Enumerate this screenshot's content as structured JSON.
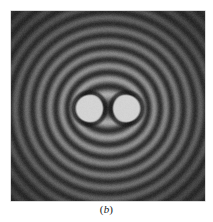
{
  "figure": {
    "caption": "(b)",
    "caption_label": "b",
    "caption_open_paren": "(",
    "caption_close_paren": ")",
    "panel_width": 194,
    "panel_height": 190,
    "panel_left": 11,
    "panel_top": 11
  },
  "colors": {
    "page_background": "#ffffff",
    "panel_background": "#1b1b1b",
    "panel_border": "#b5b5b5",
    "fringe_bright": "#c8c8c8",
    "fringe_dark": "#242424",
    "aperture_fill": "#e2e2e2",
    "caption_text": "#1c1c1c"
  },
  "chart_data": {
    "type": "heatmap",
    "title": "",
    "subtitle": "",
    "xlabel": "",
    "ylabel": "",
    "annotations": [
      "(b)"
    ],
    "legend_position": "none",
    "grid": false,
    "colormap": "grayscale",
    "value_range": [
      0,
      1
    ],
    "xlim": [
      0,
      194
    ],
    "ylim": [
      0,
      190
    ],
    "sources": [
      {
        "name": "left-aperture",
        "cx": 78,
        "cy": 97,
        "radius": 13.5,
        "value": 1.0
      },
      {
        "name": "right-aperture",
        "cx": 115,
        "cy": 97,
        "radius": 13.5,
        "value": 1.0
      }
    ],
    "fringes": {
      "count_per_side": 9,
      "wavelength_px": 11.6,
      "phase_offset_deg": 0,
      "envelope_falloff": 0.0115,
      "bright_level": 0.78,
      "dark_level": 0.12,
      "noise_amplitude": 0.05
    },
    "radial_profile_along_horizontal_midline": {
      "x": [
        0,
        8,
        14,
        20,
        26,
        32,
        38,
        44,
        50,
        56,
        62,
        68,
        74,
        80,
        86,
        92,
        97,
        102,
        108,
        114,
        120,
        126,
        132,
        138,
        144,
        150,
        156,
        162,
        168,
        174,
        180,
        188
      ],
      "gray": [
        0.11,
        0.14,
        0.28,
        0.16,
        0.34,
        0.18,
        0.42,
        0.2,
        0.52,
        0.22,
        0.62,
        0.24,
        0.7,
        0.96,
        0.96,
        0.96,
        0.55,
        0.96,
        0.96,
        0.96,
        0.7,
        0.24,
        0.62,
        0.22,
        0.52,
        0.2,
        0.42,
        0.18,
        0.34,
        0.16,
        0.28,
        0.11
      ]
    }
  }
}
